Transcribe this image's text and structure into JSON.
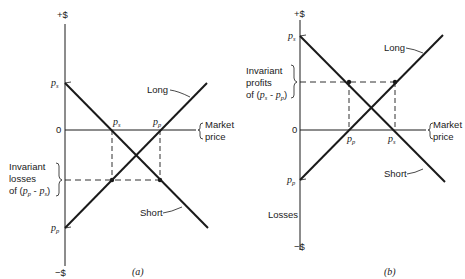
{
  "panels": [
    {
      "id": "a",
      "caption": "(a)",
      "y_axis": {
        "top_label": "+$",
        "bottom_label": "−$",
        "zero_label": "0"
      },
      "x_axis_label_line1": "Market",
      "x_axis_label_line2": "price",
      "y_tick_top": "p",
      "y_tick_top_sub": "s",
      "y_tick_bottom": "p",
      "y_tick_bottom_sub": "p",
      "x_tick_1": "p",
      "x_tick_1_sub": "s",
      "x_tick_2": "p",
      "x_tick_2_sub": "p",
      "long_label": "Long",
      "short_label": "Short",
      "bracket_label_line1": "Invariant",
      "bracket_label_line2": "losses",
      "bracket_label_line3_pre": "of (",
      "bracket_label_line3_expr": "p",
      "bracket_label_line3_sub1": "p",
      "bracket_label_line3_mid": " - ",
      "bracket_label_line3_expr2": "p",
      "bracket_label_line3_sub2": "s",
      "bracket_label_line3_post": ")"
    },
    {
      "id": "b",
      "caption": "(b)",
      "y_axis": {
        "top_label": "+$",
        "bottom_label": "−$",
        "zero_label": "0"
      },
      "x_axis_label_line1": "Market",
      "x_axis_label_line2": "price",
      "y_tick_top": "p",
      "y_tick_top_sub": "s",
      "y_tick_bottom": "p",
      "y_tick_bottom_sub": "p",
      "x_tick_1": "p",
      "x_tick_1_sub": "p",
      "x_tick_2": "p",
      "x_tick_2_sub": "s",
      "long_label": "Long",
      "short_label": "Short",
      "losses_label": "Losses",
      "bracket_label_line1": "Invariant",
      "bracket_label_line2": "profits",
      "bracket_label_line3_pre": "of (",
      "bracket_label_line3_expr": "p",
      "bracket_label_line3_sub1": "s",
      "bracket_label_line3_mid": " - ",
      "bracket_label_line3_expr2": "p",
      "bracket_label_line3_sub2": "p",
      "bracket_label_line3_post": ")"
    }
  ],
  "colors": {
    "ink": "#1a1a1a",
    "background": "#ffffff"
  }
}
